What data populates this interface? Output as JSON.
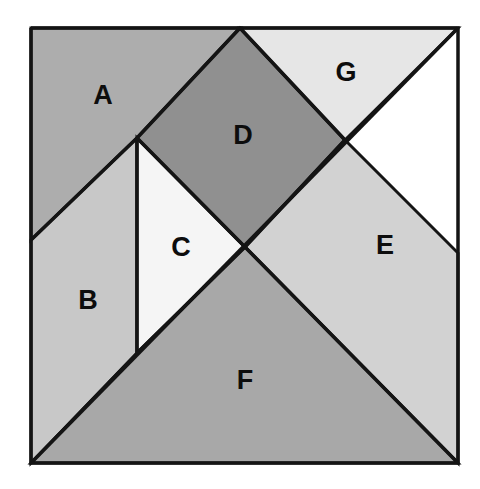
{
  "figure": {
    "kind": "geometric-dissection-diagram",
    "background_color": "#ffffff",
    "outline_color": "#141414",
    "square": {
      "x": 31,
      "y": 28,
      "width": 427,
      "height": 435
    }
  },
  "pieces": [
    {
      "id": "A",
      "label": "A",
      "shape": "triangle",
      "fill": "#adadad",
      "points": "31,28 240,28 137,138 31,240",
      "label_x": 103,
      "label_y": 95
    },
    {
      "id": "B",
      "label": "B",
      "shape": "quadrilateral",
      "fill": "#c8c8c8",
      "points": "31,240 137,138 137,353 31,463",
      "label_x": 88,
      "label_y": 300
    },
    {
      "id": "C",
      "label": "C",
      "shape": "triangle",
      "fill": "#f5f5f5",
      "points": "137,138 245,247 137,353",
      "label_x": 181,
      "label_y": 247
    },
    {
      "id": "D",
      "label": "D",
      "shape": "square-diamond",
      "fill": "#909090",
      "points": "240,28 345,140 245,247 137,138",
      "label_x": 243,
      "label_y": 135
    },
    {
      "id": "E",
      "label": "E",
      "shape": "triangle",
      "fill": "#d2d2d2",
      "points": "345,140 458,253 458,463 245,247",
      "label_x": 385,
      "label_y": 245
    },
    {
      "id": "F",
      "label": "F",
      "shape": "triangle",
      "fill": "#a8a8a8",
      "points": "245,247 458,463 31,463 137,353",
      "label_x": 245,
      "label_y": 380
    },
    {
      "id": "G",
      "label": "G",
      "shape": "triangle",
      "fill": "#e6e6e6",
      "points": "240,28 458,28 345,140",
      "label_x": 346,
      "label_y": 72
    }
  ],
  "overlay_lines": [
    {
      "name": "outer-square-border",
      "points": "31,28 458,28 458,463 31,463 31,28"
    },
    {
      "name": "main-diagonal",
      "points": "458,28 31,463"
    },
    {
      "name": "vertical-divider-b-c",
      "points": "137,138 137,353"
    },
    {
      "name": "edge-a-b",
      "points": "31,240 137,138"
    },
    {
      "name": "edge-a-d",
      "points": "137,138 240,28"
    },
    {
      "name": "edge-d-g",
      "points": "240,28 345,140"
    },
    {
      "name": "edge-d-c",
      "points": "137,138 245,247"
    },
    {
      "name": "edge-d-e",
      "points": "345,140 245,247"
    },
    {
      "name": "edge-c-f",
      "points": "245,247 137,353"
    },
    {
      "name": "edge-e-f",
      "points": "245,247 458,463"
    }
  ]
}
